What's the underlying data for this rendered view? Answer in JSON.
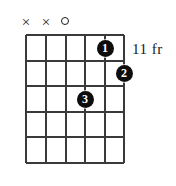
{
  "diagram": {
    "type": "guitar-chord-diagram",
    "fret_label": "11 fr",
    "strings": 6,
    "frets": 5,
    "string_markers": [
      {
        "string": 1,
        "symbol": "X",
        "state": "muted"
      },
      {
        "string": 2,
        "symbol": "X",
        "state": "muted"
      },
      {
        "string": 3,
        "symbol": "O",
        "state": "open"
      },
      {
        "string": 4,
        "symbol": "",
        "state": "none"
      },
      {
        "string": 5,
        "symbol": "",
        "state": "none"
      },
      {
        "string": 6,
        "symbol": "",
        "state": "none"
      }
    ],
    "finger_positions": [
      {
        "finger": "1",
        "string": 5,
        "fret": 1
      },
      {
        "finger": "2",
        "string": 6,
        "fret": 2
      },
      {
        "finger": "3",
        "string": 4,
        "fret": 3
      }
    ],
    "colors": {
      "background": "#ffffff",
      "grid": "#3a3a3a",
      "dot_fill": "#0d0d0d",
      "dot_text": "#ffffff",
      "text": "#1a1a1a"
    }
  }
}
